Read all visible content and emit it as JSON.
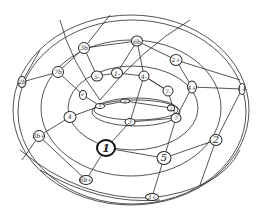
{
  "diagram": {
    "colors": {
      "stroke": "#2a2a2a",
      "background": "#ffffff"
    },
    "nodes": [
      {
        "id": "n1",
        "label": "1",
        "x": 106,
        "y": 148,
        "w": 20,
        "h": 18,
        "style": "big"
      },
      {
        "id": "n2",
        "label": "5",
        "x": 164,
        "y": 158,
        "w": 15,
        "h": 14,
        "style": "med"
      },
      {
        "id": "n3",
        "label": "2",
        "x": 216,
        "y": 140,
        "w": 13,
        "h": 12,
        "style": "med"
      },
      {
        "id": "n4",
        "label": "4",
        "x": 70,
        "y": 117,
        "w": 13,
        "h": 12,
        "style": ""
      },
      {
        "id": "n5",
        "label": "3b+",
        "x": 39,
        "y": 136,
        "w": 12,
        "h": 12,
        "style": ""
      },
      {
        "id": "n6",
        "label": "6b+",
        "x": 86,
        "y": 180,
        "w": 14,
        "h": 10,
        "style": ""
      },
      {
        "id": "n7",
        "label": "3+",
        "x": 152,
        "y": 197,
        "w": 14,
        "h": 8,
        "style": ""
      },
      {
        "id": "n8",
        "label": "3b",
        "x": 84,
        "y": 48,
        "w": 12,
        "h": 12,
        "style": ""
      },
      {
        "id": "n9",
        "label": "6b",
        "x": 137,
        "y": 41,
        "w": 12,
        "h": 11,
        "style": ""
      },
      {
        "id": "n10",
        "label": "2+",
        "x": 176,
        "y": 60,
        "w": 13,
        "h": 12,
        "style": ""
      },
      {
        "id": "n11",
        "label": "5-",
        "x": 97,
        "y": 76,
        "w": 12,
        "h": 11,
        "style": ""
      },
      {
        "id": "n12",
        "label": "1-",
        "x": 117,
        "y": 73,
        "w": 12,
        "h": 11,
        "style": ""
      },
      {
        "id": "n13",
        "label": "4-",
        "x": 144,
        "y": 76,
        "w": 11,
        "h": 11,
        "style": ""
      },
      {
        "id": "n14",
        "label": "7b",
        "x": 58,
        "y": 72,
        "w": 12,
        "h": 12,
        "style": ""
      },
      {
        "id": "n15",
        "label": "2b",
        "x": 22,
        "y": 82,
        "w": 9,
        "h": 12,
        "style": ""
      },
      {
        "id": "n16",
        "label": "7-",
        "x": 168,
        "y": 91,
        "w": 11,
        "h": 11,
        "style": ""
      },
      {
        "id": "n17",
        "label": "4+",
        "x": 192,
        "y": 87,
        "w": 10,
        "h": 13,
        "style": ""
      },
      {
        "id": "n18",
        "label": "1+",
        "x": 242,
        "y": 89,
        "w": 7,
        "h": 12,
        "style": ""
      },
      {
        "id": "n19",
        "label": "7",
        "x": 176,
        "y": 118,
        "w": 11,
        "h": 10,
        "style": ""
      },
      {
        "id": "n20",
        "label": "3",
        "x": 130,
        "y": 122,
        "w": 11,
        "h": 8,
        "style": ""
      },
      {
        "id": "n21",
        "label": "5",
        "x": 100,
        "y": 106,
        "w": 10,
        "h": 6,
        "style": ""
      },
      {
        "id": "n22",
        "label": "6",
        "x": 125,
        "y": 101,
        "w": 10,
        "h": 5,
        "style": ""
      },
      {
        "id": "n23",
        "label": "2",
        "x": 171,
        "y": 108,
        "w": 8,
        "h": 7,
        "style": ""
      },
      {
        "id": "n24",
        "label": "6-",
        "x": 83,
        "y": 95,
        "w": 8,
        "h": 10,
        "style": ""
      }
    ]
  }
}
